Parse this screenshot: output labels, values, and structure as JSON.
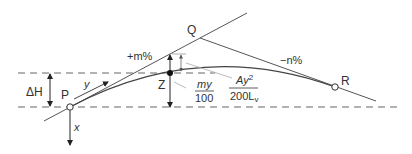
{
  "diagram": {
    "type": "vertical-curve-geometry",
    "points": {
      "P": "P",
      "Q": "Q",
      "R": "R",
      "Z": "Z"
    },
    "grades": {
      "entry": "+m%",
      "exit": "−n%"
    },
    "dimensions": {
      "delta_h": "ΔH",
      "x_axis": "x",
      "y_axis": "y",
      "tangent_offset_num": "my",
      "tangent_offset_den": "100",
      "curve_offset_num_a": "Ay",
      "curve_offset_num_exp": "2",
      "curve_offset_den_a": "200L",
      "curve_offset_den_sub": "v"
    },
    "colors": {
      "line": "#555555",
      "dash": "#666666",
      "text": "#333333",
      "leader": "#aaaaaa"
    }
  }
}
